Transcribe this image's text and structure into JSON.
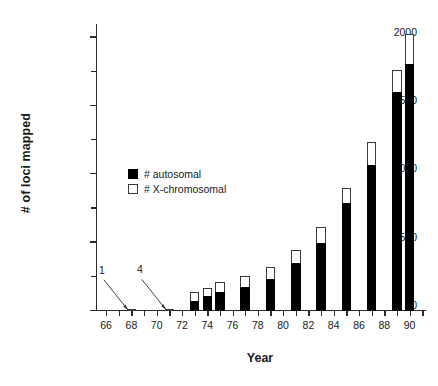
{
  "chart_data": {
    "type": "bar",
    "title": "",
    "subtitle": "",
    "xlabel": "Year",
    "ylabel": "# of loci mapped",
    "stacked": true,
    "grid": false,
    "legend_position": "inside-left",
    "xlim": [
      65.2,
      91.3
    ],
    "ylim": [
      0,
      2100
    ],
    "y_ticks_major": [
      0,
      500,
      1000,
      1500,
      2000
    ],
    "y_ticks_minor": [
      250,
      750,
      1250,
      1750
    ],
    "x_tick_labels": [
      "66",
      "68",
      "70",
      "72",
      "74",
      "76",
      "78",
      "80",
      "82",
      "84",
      "86",
      "88",
      "90"
    ],
    "x_tick_values": [
      66,
      68,
      70,
      72,
      74,
      76,
      78,
      80,
      82,
      84,
      86,
      88,
      90
    ],
    "x_minor_ticks": [
      67,
      69,
      71,
      73,
      75,
      77,
      79,
      81,
      83,
      85,
      87,
      89,
      91
    ],
    "categories": [
      66,
      67,
      68,
      69,
      70,
      71,
      72,
      73,
      74,
      75,
      76,
      77,
      78,
      79,
      80,
      81,
      82,
      83,
      84,
      85,
      86,
      87,
      88,
      89,
      90
    ],
    "series": [
      {
        "name": "# autosomal",
        "color": "#000000",
        "values": [
          0,
          0,
          0,
          0,
          0,
          0,
          0,
          0,
          75,
          110,
          140,
          0,
          175,
          0,
          235,
          0,
          350,
          0,
          500,
          0,
          790,
          0,
          1070,
          1600,
          1810
        ]
      },
      {
        "name": "# X-chromosomal",
        "color": "#ffffff",
        "values": [
          0,
          1,
          0,
          0,
          4,
          0,
          0,
          0,
          65,
          60,
          75,
          0,
          80,
          0,
          85,
          0,
          100,
          0,
          115,
          0,
          110,
          0,
          165,
          165,
          215
        ]
      }
    ],
    "totals": [
      0,
      1,
      0,
      0,
      4,
      0,
      0,
      0,
      140,
      170,
      215,
      0,
      255,
      0,
      320,
      0,
      450,
      0,
      615,
      0,
      900,
      0,
      1235,
      1765,
      2025
    ],
    "bars": [
      {
        "year": 68,
        "autosomal": 0,
        "xchrom": 1,
        "total": 1
      },
      {
        "year": 71,
        "autosomal": 0,
        "xchrom": 4,
        "total": 4
      },
      {
        "year": 73,
        "autosomal": 75,
        "xchrom": 65,
        "total": 140
      },
      {
        "year": 74,
        "autosomal": 110,
        "xchrom": 60,
        "total": 170
      },
      {
        "year": 75,
        "autosomal": 140,
        "xchrom": 75,
        "total": 215
      },
      {
        "year": 77,
        "autosomal": 175,
        "xchrom": 80,
        "total": 255
      },
      {
        "year": 79,
        "autosomal": 235,
        "xchrom": 85,
        "total": 320
      },
      {
        "year": 81,
        "autosomal": 350,
        "xchrom": 100,
        "total": 450
      },
      {
        "year": 83,
        "autosomal": 500,
        "xchrom": 115,
        "total": 615
      },
      {
        "year": 85,
        "autosomal": 790,
        "xchrom": 110,
        "total": 900
      },
      {
        "year": 87,
        "autosomal": 1070,
        "xchrom": 165,
        "total": 1235
      },
      {
        "year": 89,
        "autosomal": 1600,
        "xchrom": 165,
        "total": 1765
      },
      {
        "year": 90,
        "autosomal": 1810,
        "xchrom": 215,
        "total": 2025
      }
    ],
    "annotations": [
      {
        "text": "1",
        "points_to_year": 68
      },
      {
        "text": "4",
        "points_to_year": 71
      }
    ],
    "legend": [
      {
        "label": "# autosomal",
        "swatch": "filled"
      },
      {
        "label": "# X-chromosomal",
        "swatch": "hollow"
      }
    ]
  }
}
